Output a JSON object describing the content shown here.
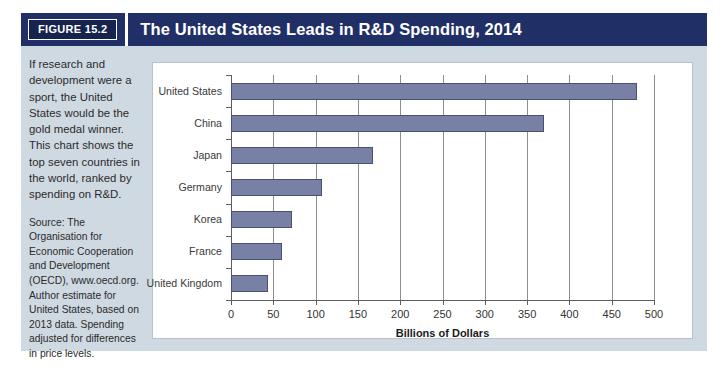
{
  "figure": {
    "tag": "FIGURE 15.2",
    "title": "The United States Leads in R&D Spending, 2014"
  },
  "caption": {
    "body": "If research and development were a sport, the United States would be the gold medal winner. This chart shows the top seven countries in the world, ranked by spending on R&D.",
    "source": "Source: The Organisation for Economic Cooperation and Development (OECD), www.oecd.org. Author estimate for United States, based on 2013 data. Spending adjusted for differences in price levels."
  },
  "colors": {
    "banner": "#203067",
    "figure_tag": "#16234e",
    "panel": "#cfd9e2",
    "bar_fill": "#7880a6",
    "bar_stroke": "#4a5170",
    "chart_bg": "#ffffff"
  },
  "chart_data": {
    "type": "bar",
    "orientation": "horizontal",
    "title": "The United States Leads in R&D Spending, 2014",
    "categories": [
      "United States",
      "China",
      "Japan",
      "Germany",
      "Korea",
      "France",
      "United Kingdom"
    ],
    "values": [
      480,
      370,
      168,
      108,
      72,
      60,
      44
    ],
    "xlabel": "Billions of Dollars",
    "ylabel": "",
    "xlim": [
      0,
      500
    ],
    "xticks": [
      0,
      50,
      100,
      150,
      200,
      250,
      300,
      350,
      400,
      450,
      500
    ],
    "xtick_labels": [
      "0",
      "50",
      "100",
      "150",
      "200",
      "250",
      "300",
      "350",
      "400",
      "450",
      "500"
    ],
    "grid": true,
    "grid_axis": "x",
    "legend": false,
    "units": "billions of US dollars"
  }
}
